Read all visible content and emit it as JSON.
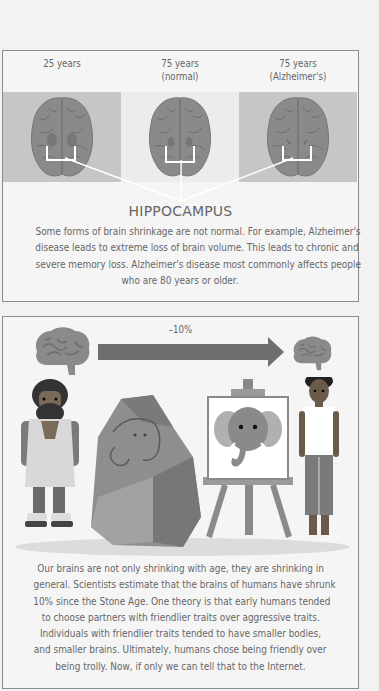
{
  "section1": {
    "columns": [
      {
        "label_line1": "25 years",
        "label_line2": "",
        "panel_shade": "gray"
      },
      {
        "label_line1": "75 years",
        "label_line2": "(normal)",
        "panel_shade": "light"
      },
      {
        "label_line1": "75 years",
        "label_line2": "(Alzheimer's)",
        "panel_shade": "gray"
      }
    ],
    "callout_title": "HIPPOCAMPUS",
    "paragraph_lines": [
      "Some forms of brain shrinkage are not normal. For example, Alzheimer's",
      "disease leads to extreme loss of brain volume. This leads to chronic and",
      "severe memory loss. Alzheimer's disease most commonly affects people",
      "who are 80 years or older."
    ]
  },
  "section2": {
    "arrow_label": "–10%",
    "illustration": {
      "left_icon": "brain-large-icon",
      "arrow_icon": "arrow-right-icon",
      "right_icon": "brain-small-icon",
      "figures": [
        "caveman",
        "cave-rock-with-mammoth-painting",
        "easel-with-elephant-painting",
        "modern-person"
      ]
    },
    "paragraph_lines": [
      "Our brains are not only shrinking with age, they are shrinking in",
      "general. Scientists estimate that the brains of humans have shrunk",
      "10% since the Stone Age. One theory is that early humans tended",
      "to choose partners with friendlier traits over aggressive traits.",
      "Individuals with friendlier traits tended to have smaller bodies,",
      "and smaller brains. Ultimately, humans chose being friendly over",
      "being trolly. Now, if only we can tell that to the Internet."
    ]
  },
  "colors": {
    "border": "#8c8c8c",
    "panel_gray": "#c6c6c6",
    "panel_light": "#ececec",
    "brain": "#8a8a8a",
    "text": "#666666",
    "background": "#f2f2f2"
  }
}
